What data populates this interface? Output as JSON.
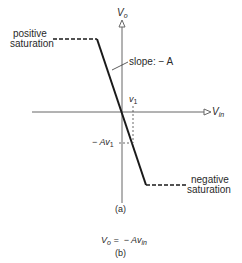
{
  "figure": {
    "axes": {
      "y_label": "V",
      "y_sub": "o",
      "x_label": "V",
      "x_sub": "in"
    },
    "annotations": {
      "positive_saturation_line1": "positive",
      "positive_saturation_line2": "saturation",
      "negative_saturation_line1": "negative",
      "negative_saturation_line2": "saturation",
      "slope": "slope: − A",
      "v1": "v",
      "v1_sub": "1",
      "neg_av1": "− Av",
      "neg_av1_sub": "1"
    },
    "caption_a": "(a)",
    "equation": {
      "lhs": "V",
      "lhs_sub": "o",
      "rhs": " =  − Av",
      "rhs_sub": "in"
    },
    "caption_b": "(b)",
    "colors": {
      "axis": "#555555",
      "curve": "#1a1a1a",
      "text": "#2a2a2a"
    }
  }
}
